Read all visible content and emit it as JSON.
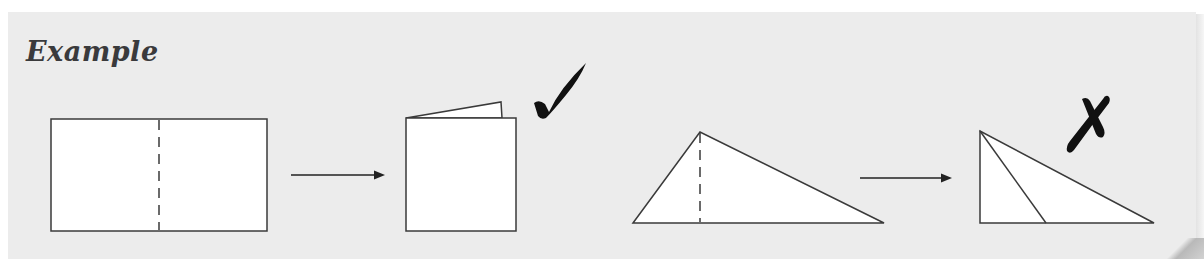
{
  "header": {
    "title": "Example"
  },
  "colors": {
    "panel_bg": "#ececec",
    "shape_fill": "#ffffff",
    "stroke": "#3a3a3a",
    "mark": "#111111"
  },
  "examples": [
    {
      "name": "rectangle-fold",
      "before": {
        "shape": "rectangle",
        "fold_line": "vertical-dashed-center"
      },
      "after": {
        "shape": "folded-rectangle",
        "halves_match": true
      },
      "verdict": {
        "icon": "check-mark-icon",
        "correct": true
      }
    },
    {
      "name": "triangle-fold",
      "before": {
        "shape": "obtuse-triangle",
        "fold_line": "vertical-dashed-altitude"
      },
      "after": {
        "shape": "folded-triangle",
        "halves_match": false
      },
      "verdict": {
        "icon": "cross-mark-icon",
        "correct": false
      }
    }
  ]
}
